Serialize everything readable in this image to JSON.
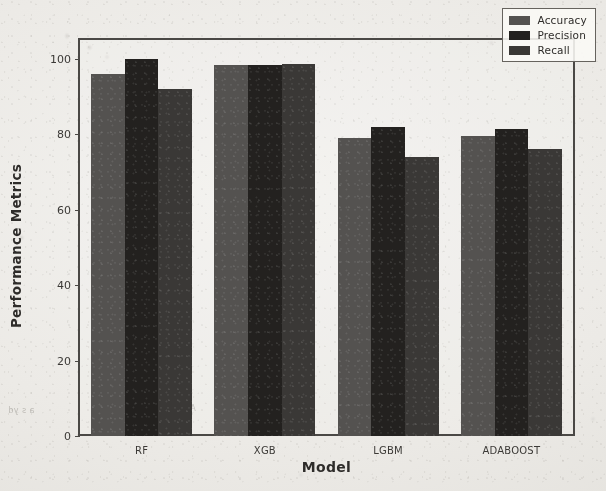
{
  "chart_data": {
    "type": "bar",
    "title": "",
    "xlabel": "Model",
    "ylabel": "Performance Metrics",
    "categories": [
      "RF",
      "XGB",
      "LGBM",
      "ADABOOST"
    ],
    "series": [
      {
        "name": "Accuracy",
        "color": "#545250",
        "values": [
          96.0,
          98.5,
          79.0,
          79.5
        ]
      },
      {
        "name": "Precision",
        "color": "#23211f",
        "values": [
          100.0,
          98.3,
          82.0,
          81.5
        ]
      },
      {
        "name": "Recall",
        "color": "#3a3836",
        "values": [
          92.0,
          98.6,
          74.0,
          76.0
        ]
      }
    ],
    "ylim": [
      0,
      105
    ],
    "yticks": [
      0,
      20,
      40,
      60,
      80,
      100
    ],
    "ytick_labels": [
      "0",
      "20",
      "40",
      "60",
      "80",
      "100"
    ],
    "grid": false,
    "legend_position": "upper right",
    "bar_group_gap": 0.18,
    "axes_color": "#4a4845",
    "background_color": "#efedea"
  },
  "figure": {
    "frame_visible": true,
    "artifacts": {
      "bleed_text_left": "a s yd",
      "bleed_text_bottom": "AAMAAAAAAA"
    }
  }
}
